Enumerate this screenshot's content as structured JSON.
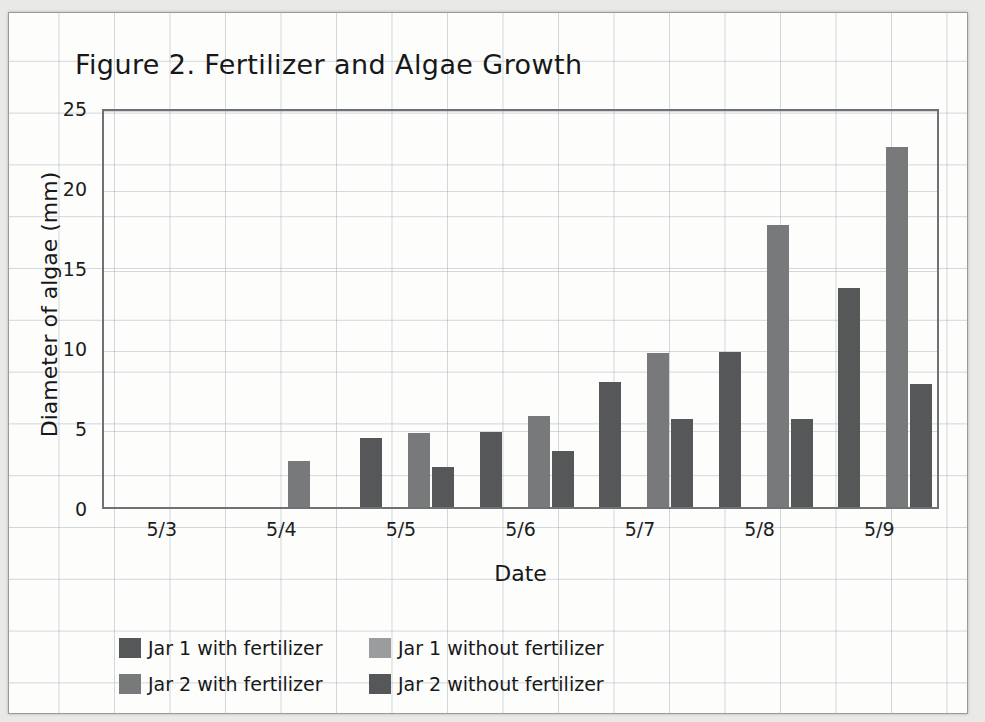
{
  "chart_data": {
    "type": "bar",
    "title": "Figure 2. Fertilizer and Algae Growth",
    "xlabel": "Date",
    "ylabel": "Diameter of algae (mm)",
    "categories": [
      "5/3",
      "5/4",
      "5/5",
      "5/6",
      "5/7",
      "5/8",
      "5/9"
    ],
    "ylim": [
      0,
      25
    ],
    "yticks": [
      0,
      5,
      10,
      15,
      20,
      25
    ],
    "grid": true,
    "legend_position": "bottom-left",
    "series": [
      {
        "name": "Jar 1 with fertilizer",
        "color": "#555759",
        "values": [
          0,
          0,
          4.3,
          4.7,
          7.8,
          9.7,
          13.7
        ]
      },
      {
        "name": "Jar 1 without fertilizer",
        "color": "#9a9c9e",
        "values": [
          0,
          0,
          0,
          0,
          0,
          0,
          0
        ]
      },
      {
        "name": "Jar 2 with fertilizer",
        "color": "#77797b",
        "values": [
          0,
          2.9,
          4.6,
          5.7,
          9.6,
          17.6,
          22.5
        ]
      },
      {
        "name": "Jar 2 without fertilizer",
        "color": "#555759",
        "values": [
          0,
          0,
          2.5,
          3.5,
          5.5,
          5.5,
          7.7
        ]
      }
    ]
  },
  "legend": {
    "items": [
      {
        "label": "Jar 1 with fertilizer",
        "color": "#555759"
      },
      {
        "label": "Jar 1 without fertilizer",
        "color": "#9a9c9e"
      },
      {
        "label": "Jar 2 with fertilizer",
        "color": "#77797b"
      },
      {
        "label": "Jar 2 without fertilizer",
        "color": "#555759"
      }
    ]
  },
  "colors": {
    "page": "#fdfdfb",
    "grid": "#96a2af",
    "axis": "#6e7275",
    "text": "#16181a"
  }
}
